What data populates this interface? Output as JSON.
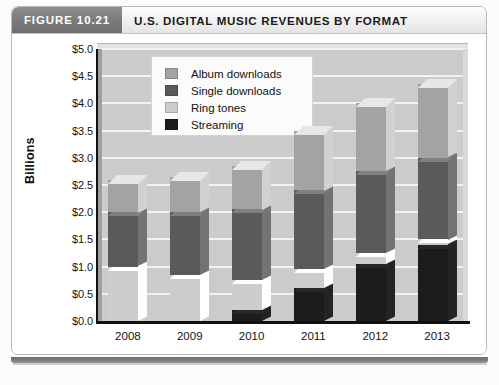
{
  "figure": {
    "tab_label": "FIGURE 10.21",
    "title": "U.S. DIGITAL MUSIC REVENUES BY FORMAT"
  },
  "chart_data": {
    "type": "bar",
    "subtype": "stacked-column-3d",
    "title": "U.S. DIGITAL MUSIC REVENUES BY FORMAT",
    "xlabel": "",
    "ylabel": "Billions",
    "ylim": [
      0,
      5
    ],
    "ytick_step": 0.5,
    "grid": true,
    "legend_position": "top-left-inside",
    "categories": [
      "2008",
      "2009",
      "2010",
      "2011",
      "2012",
      "2013"
    ],
    "ytick_labels": [
      "$0.0",
      "$0.5",
      "$1.0",
      "$1.5",
      "$2.0",
      "$2.5",
      "$3.0",
      "$3.5",
      "$4.0",
      "$4.5",
      "$5.0"
    ],
    "stack_order_bottom_to_top": [
      "Streaming",
      "Ring tones",
      "Single downloads",
      "Album downloads"
    ],
    "series": [
      {
        "name": "Streaming",
        "color": "#1c1c1c",
        "values": [
          0.0,
          0.0,
          0.2,
          0.6,
          1.05,
          1.4
        ]
      },
      {
        "name": "Ring tones",
        "color": "#cdcdcd",
        "values": [
          1.0,
          0.85,
          0.55,
          0.35,
          0.2,
          0.1
        ]
      },
      {
        "name": "Single downloads",
        "color": "#5a5a5a",
        "values": [
          1.0,
          1.15,
          1.3,
          1.45,
          1.5,
          1.5
        ]
      },
      {
        "name": "Album downloads",
        "color": "#a3a3a3",
        "values": [
          0.6,
          0.65,
          0.8,
          1.1,
          1.25,
          1.35
        ]
      }
    ],
    "totals": [
      2.6,
      2.65,
      2.85,
      3.5,
      4.0,
      4.35
    ]
  },
  "legend": {
    "items": [
      {
        "label": "Album downloads",
        "color": "#a3a3a3"
      },
      {
        "label": "Single downloads",
        "color": "#5a5a5a"
      },
      {
        "label": "Ring tones",
        "color": "#cdcdcd"
      },
      {
        "label": "Streaming",
        "color": "#1c1c1c"
      }
    ]
  }
}
